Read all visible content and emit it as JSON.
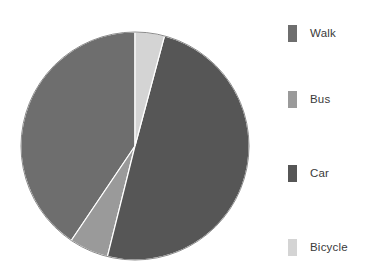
{
  "chart_data": {
    "type": "pie",
    "title": "",
    "categories": [
      "Walk",
      "Bus",
      "Car",
      "Bicycle"
    ],
    "values": [
      40.5,
      5.5,
      50.0,
      4.0
    ],
    "unit": "percent",
    "legend_position": "right",
    "grid": false,
    "start_angle_deg": 0,
    "direction": "clockwise",
    "slices": [
      {
        "label": "Walk",
        "value": 40.5,
        "angle_deg": 146,
        "start_deg": 214,
        "end_deg": 360,
        "color": "#6e6e6e"
      },
      {
        "label": "Bus",
        "value": 5.5,
        "angle_deg": 20,
        "start_deg": 194,
        "end_deg": 214,
        "color": "#9a9a9a"
      },
      {
        "label": "Car",
        "value": 50.0,
        "angle_deg": 179,
        "start_deg": 15,
        "end_deg": 194,
        "color": "#565656"
      },
      {
        "label": "Bicycle",
        "value": 4.0,
        "angle_deg": 15,
        "start_deg": 0,
        "end_deg": 15,
        "color": "#d4d4d4"
      }
    ]
  },
  "legend": {
    "items": [
      {
        "label": "Walk",
        "color": "#6e6e6e",
        "swatch_name": "legend-swatch-walk"
      },
      {
        "label": "Bus",
        "color": "#9a9a9a",
        "swatch_name": "legend-swatch-bus"
      },
      {
        "label": "Car",
        "color": "#565656",
        "swatch_name": "legend-swatch-car"
      },
      {
        "label": "Bicycle",
        "color": "#d4d4d4",
        "swatch_name": "legend-swatch-bicycle"
      }
    ]
  },
  "geometry": {
    "center_x": 117,
    "center_y": 118,
    "radius": 114,
    "outline_color": "#8c8c8c"
  },
  "colors": {
    "background": "#ffffff",
    "text": "#3a3a3a"
  }
}
